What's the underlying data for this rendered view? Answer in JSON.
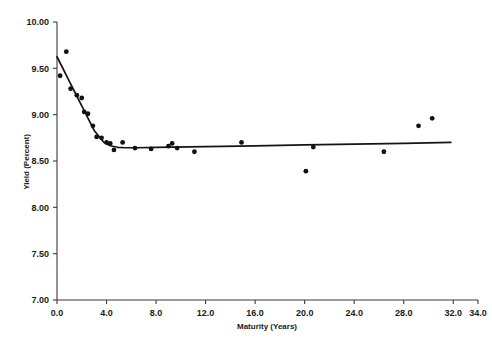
{
  "chart_data": {
    "type": "scatter",
    "title": "",
    "xlabel": "Maturity (Years)",
    "ylabel": "Yield (Percent)",
    "xlim": [
      0.0,
      34.0
    ],
    "ylim": [
      7.0,
      10.0
    ],
    "xticks": [
      "0.0",
      "4.0",
      "8.0",
      "12.0",
      "16.0",
      "20.0",
      "24.0",
      "28.0",
      "32.0",
      "34.0"
    ],
    "xtick_values": [
      0.0,
      4.0,
      8.0,
      12.0,
      16.0,
      20.0,
      24.0,
      28.0,
      32.0,
      34.0
    ],
    "yticks": [
      "7.00",
      "7.50",
      "8.00",
      "8.50",
      "9.00",
      "9.50",
      "10.00"
    ],
    "ytick_values": [
      7.0,
      7.5,
      8.0,
      8.5,
      9.0,
      9.5,
      10.0
    ],
    "grid": false,
    "legend": "none",
    "x": [
      0.25,
      0.75,
      1.1,
      1.6,
      2.0,
      2.2,
      2.5,
      2.9,
      3.2,
      3.6,
      4.0,
      4.3,
      4.6,
      5.3,
      6.3,
      7.6,
      9.0,
      9.3,
      9.7,
      11.1,
      14.9,
      20.1,
      20.7,
      26.4,
      29.2,
      30.3
    ],
    "y": [
      9.42,
      9.68,
      9.28,
      9.21,
      9.18,
      9.03,
      9.01,
      8.88,
      8.76,
      8.75,
      8.7,
      8.69,
      8.62,
      8.7,
      8.64,
      8.63,
      8.66,
      8.69,
      8.64,
      8.6,
      8.7,
      8.39,
      8.65,
      8.6,
      8.88,
      8.96
    ],
    "series": [
      {
        "name": "Observed yields",
        "marker": "filled-circle",
        "color": "#111111"
      }
    ],
    "fit_line": {
      "name": "Fitted spline",
      "color": "#141414",
      "x": [
        0.0,
        1.0,
        2.0,
        3.0,
        3.8,
        4.3,
        4.9,
        5.6,
        6.5,
        8.0,
        12.0,
        16.0,
        20.0,
        24.0,
        28.0,
        31.8
      ],
      "y": [
        9.625,
        9.36,
        9.095,
        8.83,
        8.7,
        8.665,
        8.648,
        8.643,
        8.643,
        8.646,
        8.655,
        8.664,
        8.673,
        8.682,
        8.691,
        8.7
      ]
    }
  },
  "axes": {
    "y_axis_title": "Yield (Percent)",
    "x_axis_title": "Maturity (Years)"
  }
}
